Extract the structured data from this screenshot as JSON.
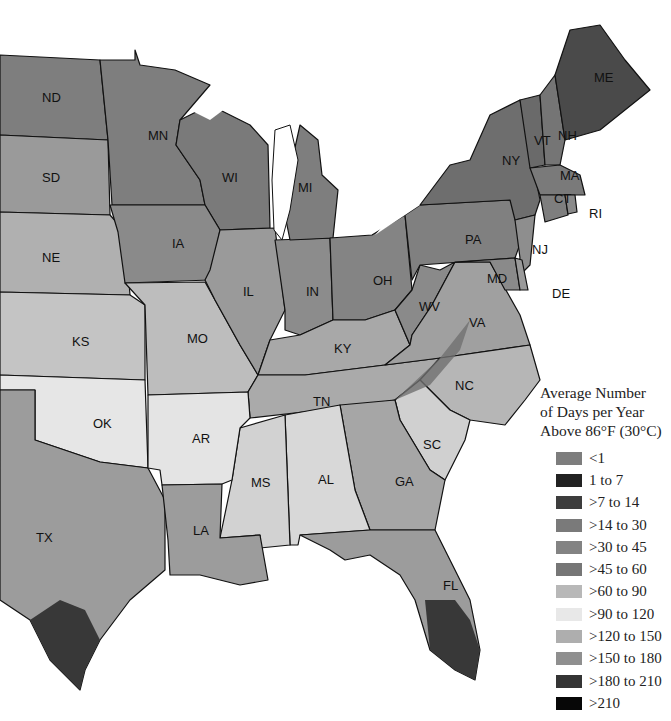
{
  "map": {
    "title": "Average Number of Days per Year Above 86°F (30°C)",
    "region": "Central and Eastern United States",
    "states": [
      {
        "code": "ND",
        "x": 42,
        "y": 102
      },
      {
        "code": "MN",
        "x": 148,
        "y": 140
      },
      {
        "code": "SD",
        "x": 42,
        "y": 182
      },
      {
        "code": "WI",
        "x": 222,
        "y": 182
      },
      {
        "code": "MI",
        "x": 298,
        "y": 192
      },
      {
        "code": "NE",
        "x": 42,
        "y": 262
      },
      {
        "code": "IA",
        "x": 172,
        "y": 248
      },
      {
        "code": "IL",
        "x": 243,
        "y": 296
      },
      {
        "code": "IN",
        "x": 306,
        "y": 296
      },
      {
        "code": "OH",
        "x": 373,
        "y": 285
      },
      {
        "code": "PA",
        "x": 465,
        "y": 244
      },
      {
        "code": "NY",
        "x": 502,
        "y": 165
      },
      {
        "code": "VT",
        "x": 534,
        "y": 145
      },
      {
        "code": "NH",
        "x": 558,
        "y": 140
      },
      {
        "code": "ME",
        "x": 594,
        "y": 82
      },
      {
        "code": "MA",
        "x": 560,
        "y": 180
      },
      {
        "code": "CT",
        "x": 554,
        "y": 203
      },
      {
        "code": "RI",
        "x": 589,
        "y": 218
      },
      {
        "code": "NJ",
        "x": 532,
        "y": 254
      },
      {
        "code": "DE",
        "x": 552,
        "y": 298
      },
      {
        "code": "MD",
        "x": 487,
        "y": 283
      },
      {
        "code": "WV",
        "x": 419,
        "y": 311
      },
      {
        "code": "VA",
        "x": 469,
        "y": 327
      },
      {
        "code": "KS",
        "x": 72,
        "y": 346
      },
      {
        "code": "MO",
        "x": 187,
        "y": 343
      },
      {
        "code": "KY",
        "x": 334,
        "y": 353
      },
      {
        "code": "NC",
        "x": 455,
        "y": 390
      },
      {
        "code": "TN",
        "x": 313,
        "y": 406
      },
      {
        "code": "OK",
        "x": 93,
        "y": 428
      },
      {
        "code": "AR",
        "x": 192,
        "y": 443
      },
      {
        "code": "SC",
        "x": 423,
        "y": 449
      },
      {
        "code": "MS",
        "x": 251,
        "y": 487
      },
      {
        "code": "AL",
        "x": 318,
        "y": 484
      },
      {
        "code": "GA",
        "x": 395,
        "y": 486
      },
      {
        "code": "TX",
        "x": 36,
        "y": 542
      },
      {
        "code": "LA",
        "x": 193,
        "y": 535
      },
      {
        "code": "FL",
        "x": 443,
        "y": 590
      }
    ]
  },
  "legend": {
    "title_lines": [
      "Average Number",
      "of Days per Year",
      "Above 86°F (30°C)"
    ],
    "items": [
      {
        "label": "<1",
        "color": "#7d7d7d"
      },
      {
        "label": "1 to 7",
        "color": "#222222"
      },
      {
        "label": ">7 to 14",
        "color": "#3d3d3d"
      },
      {
        "label": ">14 to 30",
        "color": "#7a7a7a"
      },
      {
        "label": ">30 to 45",
        "color": "#838383"
      },
      {
        "label": ">45 to 60",
        "color": "#767676"
      },
      {
        "label": ">60 to 90",
        "color": "#b8b8b8"
      },
      {
        "label": ">90 to 120",
        "color": "#e8e8e8"
      },
      {
        "label": ">120 to 150",
        "color": "#aeaeae"
      },
      {
        "label": ">150 to 180",
        "color": "#8f8f8f"
      },
      {
        "label": ">180 to 210",
        "color": "#343434"
      },
      {
        "label": ">210",
        "color": "#070707"
      }
    ]
  },
  "colors": {
    "north": "#7e7e7e",
    "dark": "#4a4a4a",
    "mid": "#9a9a9a",
    "light": "#bcbcbc",
    "verylight": "#e6e6e6",
    "gulf": "#9c9c9c",
    "south_dark": "#383838",
    "border": "#111111",
    "water": "#ffffff"
  }
}
